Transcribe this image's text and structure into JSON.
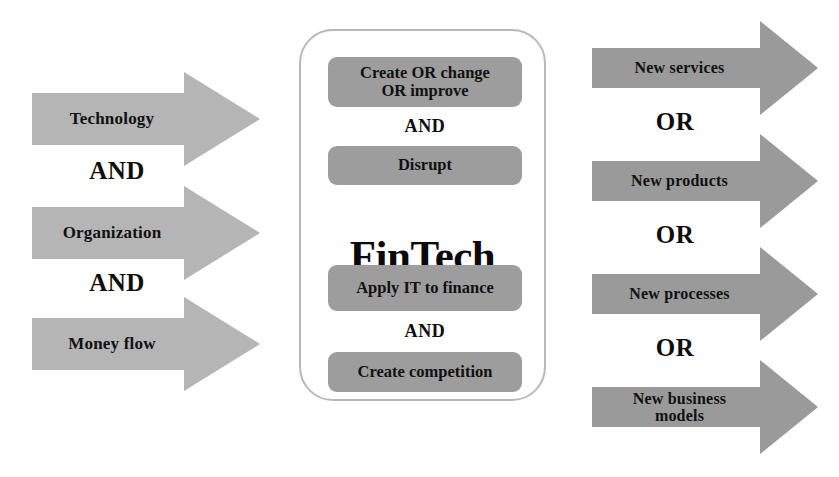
{
  "diagram": {
    "colors": {
      "input_arrow_fill": "#b5b5b5",
      "output_arrow_fill": "#9a9a9a",
      "center_box_fill": "#9d9d9d",
      "center_panel_border": "#b9b9b9",
      "background": "#ffffff",
      "text": "#111111"
    },
    "inputs": {
      "arrows": [
        {
          "label": "Technology"
        },
        {
          "label": "Organization"
        },
        {
          "label": "Money flow"
        }
      ],
      "connectors": [
        {
          "label": "AND"
        },
        {
          "label": "AND"
        }
      ]
    },
    "center": {
      "title": "FinTech",
      "boxes": [
        {
          "label": "Create OR change OR improve",
          "line1": "Create OR change",
          "line2": "OR improve"
        },
        {
          "label": "Disrupt"
        },
        {
          "label": "Apply IT to finance"
        },
        {
          "label": "Create competition"
        }
      ],
      "connectors": [
        {
          "label": "AND"
        },
        {
          "label": "AND"
        }
      ]
    },
    "outputs": {
      "arrows": [
        {
          "label": "New services",
          "line1": "New services",
          "line2": ""
        },
        {
          "label": "New products",
          "line1": "New products",
          "line2": ""
        },
        {
          "label": "New processes",
          "line1": "New processes",
          "line2": ""
        },
        {
          "label": "New business models",
          "line1": "New business",
          "line2": "models"
        }
      ],
      "connectors": [
        {
          "label": "OR"
        },
        {
          "label": "OR"
        },
        {
          "label": "OR"
        }
      ]
    }
  }
}
